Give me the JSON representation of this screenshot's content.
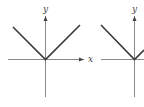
{
  "figure": {
    "panels": [
      {
        "id": "left",
        "x_label": "x",
        "y_label": "y",
        "description": "V-shaped graph, vertex at origin"
      },
      {
        "id": "right",
        "x_label": "",
        "y_label": "y",
        "description": "V-shaped graph, vertex at origin (partially cropped)"
      }
    ],
    "colors": {
      "axis": "#8a8a8a",
      "curve": "#3a3a3a",
      "label": "#444444"
    }
  }
}
